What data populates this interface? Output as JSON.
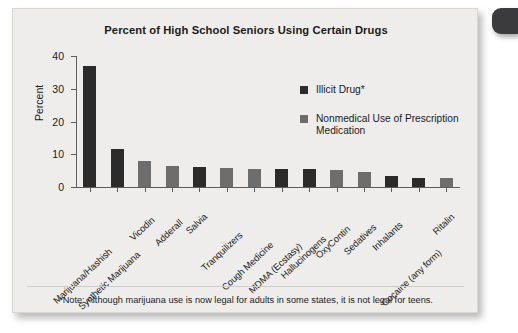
{
  "chart_data": {
    "type": "bar",
    "title": "Percent of High School Seniors Using Certain Drugs",
    "xlabel": "",
    "ylabel": "Percent",
    "ylim": [
      0,
      40
    ],
    "yticks": [
      0,
      10,
      20,
      30,
      40
    ],
    "grid": false,
    "legend_position": "inside-top-right",
    "categories": [
      "Marijuana/Hashish",
      "Synthetic Marijuana",
      "Vicodin",
      "Adderall",
      "Salvia",
      "Tranquilizers",
      "Cough Medicine",
      "MDMA (Ecstasy)",
      "Hallucinogens",
      "OxyContin",
      "Sedatives",
      "Inhalants",
      "Cocaine (any form)",
      "Ritalin"
    ],
    "values": [
      37,
      11.5,
      8,
      6.5,
      6,
      5.7,
      5.5,
      5.5,
      5.5,
      5.1,
      4.5,
      3.4,
      2.8,
      2.8
    ],
    "point_categories": [
      "Illicit Drug*",
      "Nonmedical Use of Prescription Medication",
      "Illicit Drug*",
      "Nonmedical Use of Prescription Medication",
      "Illicit Drug*",
      "Nonmedical Use of Prescription Medication",
      "Nonmedical Use of Prescription Medication",
      "Illicit Drug*",
      "Illicit Drug*",
      "Nonmedical Use of Prescription Medication",
      "Nonmedical Use of Prescription Medication",
      "Illicit Drug*",
      "Illicit Drug*",
      "Nonmedical Use of Prescription Medication"
    ],
    "bars": [
      {
        "category": "Marijuana/Hashish",
        "value": 37,
        "series": "illicit",
        "color": "#2b2b2b"
      },
      {
        "category": "Synthetic Marijuana",
        "value": 11.5,
        "series": "illicit",
        "color": "#2b2b2b"
      },
      {
        "category": "Vicodin",
        "value": 8,
        "series": "rx",
        "color": "#6d6d6d"
      },
      {
        "category": "Adderall",
        "value": 6.5,
        "series": "rx",
        "color": "#6d6d6d"
      },
      {
        "category": "Salvia",
        "value": 6,
        "series": "illicit",
        "color": "#2b2b2b"
      },
      {
        "category": "Tranquilizers",
        "value": 5.7,
        "series": "rx",
        "color": "#6d6d6d"
      },
      {
        "category": "Cough Medicine",
        "value": 5.5,
        "series": "rx",
        "color": "#6d6d6d"
      },
      {
        "category": "MDMA (Ecstasy)",
        "value": 5.5,
        "series": "illicit",
        "color": "#2b2b2b"
      },
      {
        "category": "Hallucinogens",
        "value": 5.5,
        "series": "illicit",
        "color": "#2b2b2b"
      },
      {
        "category": "OxyContin",
        "value": 5.1,
        "series": "rx",
        "color": "#6d6d6d"
      },
      {
        "category": "Sedatives",
        "value": 4.5,
        "series": "rx",
        "color": "#6d6d6d"
      },
      {
        "category": "Inhalants",
        "value": 3.4,
        "series": "illicit",
        "color": "#2b2b2b"
      },
      {
        "category": "Cocaine (any form)",
        "value": 2.8,
        "series": "illicit",
        "color": "#2b2b2b"
      },
      {
        "category": "Ritalin",
        "value": 2.8,
        "series": "rx",
        "color": "#6d6d6d"
      }
    ],
    "legend": [
      {
        "label": "Illicit Drug*",
        "color": "#2b2b2b",
        "key": "illicit"
      },
      {
        "label": "Nonmedical Use of Prescription Medication",
        "color": "#6d6d6d",
        "key": "rx"
      }
    ],
    "annotations": [
      "*Note: Although marijuana use is now legal for adults in some states, it is not legal for teens."
    ]
  },
  "footnote": "*Note: Although marijuana use is now legal for adults in some states, it is not legal for teens.",
  "colors": {
    "illicit": "#2b2b2b",
    "prescription": "#6d6d6d",
    "card_background": "#eeedeb",
    "axis": "#5d5d5d",
    "text": "#1a1a1a"
  }
}
